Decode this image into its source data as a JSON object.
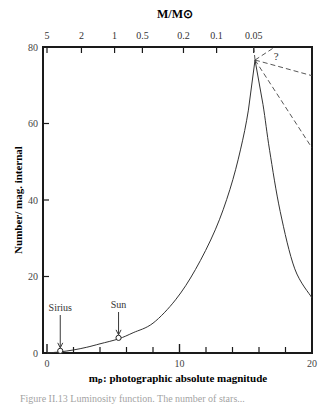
{
  "chart_data": {
    "type": "line",
    "title": "",
    "top_axis_label": "M/M⊙",
    "xlabel": "mₚ: photographic absolute magnitude",
    "ylabel": "Number/ mag. internal",
    "xlim": [
      0,
      20
    ],
    "ylim": [
      0,
      80
    ],
    "x_ticks": [
      0,
      10,
      20
    ],
    "x_minor_ticks": [
      2,
      4,
      6,
      8,
      12,
      14,
      16,
      18
    ],
    "y_ticks": [
      0,
      20,
      40,
      60,
      80
    ],
    "top_ticks": [
      {
        "label": "5",
        "x": 0.0
      },
      {
        "label": "2",
        "x": 2.6
      },
      {
        "label": "1",
        "x": 5.1
      },
      {
        "label": "0.5",
        "x": 7.2
      },
      {
        "label": "0.2",
        "x": 10.3
      },
      {
        "label": "0.1",
        "x": 12.8
      },
      {
        "label": "0.05",
        "x": 15.6
      }
    ],
    "grid": false,
    "series": [
      {
        "name": "luminosity function",
        "style": "solid",
        "x": [
          0.0,
          1.0,
          2.0,
          3.0,
          4.0,
          5.4,
          6.5,
          8.0,
          9.7,
          11.2,
          12.7,
          13.8,
          14.6,
          15.2,
          15.7,
          16.3,
          16.8,
          17.6,
          18.7,
          20.0
        ],
        "y": [
          0.0,
          0.3,
          0.8,
          1.5,
          2.4,
          3.7,
          5.3,
          7.8,
          13.9,
          21.8,
          32.2,
          42.7,
          53.1,
          63.5,
          76.6,
          65.0,
          53.0,
          37.0,
          22.0,
          14.4
        ]
      },
      {
        "name": "uncertain extension (upper)",
        "style": "dashed",
        "x": [
          15.7,
          20.0
        ],
        "y": [
          76.6,
          72.5
        ]
      },
      {
        "name": "uncertain extension (lower)",
        "style": "dashed",
        "x": [
          15.7,
          20.0
        ],
        "y": [
          76.6,
          53.6
        ]
      },
      {
        "name": "uncertain extension (steep)",
        "style": "dashed",
        "x": [
          15.7,
          17.2
        ],
        "y": [
          76.6,
          80.0
        ]
      },
      {
        "name": "uncertain extension (vertical)",
        "style": "dashed",
        "x": [
          15.7,
          15.6
        ],
        "y": [
          76.6,
          80.0
        ]
      }
    ],
    "annotations": [
      {
        "text": "Sirius",
        "x": 1.0,
        "y": 0.3,
        "marker": "open-circle",
        "arrow": true
      },
      {
        "text": "Sun",
        "x": 5.4,
        "y": 3.7,
        "marker": "open-circle",
        "arrow": true
      },
      {
        "text": "?",
        "x": 17.3,
        "y": 77.5
      }
    ]
  },
  "caption": "Figure II.13  Luminosity function. The number of stars..."
}
